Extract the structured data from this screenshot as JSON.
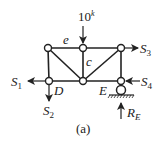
{
  "figure": {
    "caption": "(a)",
    "load": {
      "value": "10",
      "unit": "k"
    },
    "member_labels": {
      "top_left": "e",
      "vertical_middle": "c"
    },
    "node_labels": {
      "bottom_left": "D",
      "bottom_right": "E"
    },
    "forces": {
      "S1": {
        "base": "S",
        "sub": "1"
      },
      "S2": {
        "base": "S",
        "sub": "2"
      },
      "S3": {
        "base": "S",
        "sub": "3"
      },
      "S4": {
        "base": "S",
        "sub": "4"
      },
      "RE": {
        "base": "R",
        "sub": "E"
      }
    },
    "colors": {
      "line": "#222222",
      "background": "#ffffff"
    }
  }
}
